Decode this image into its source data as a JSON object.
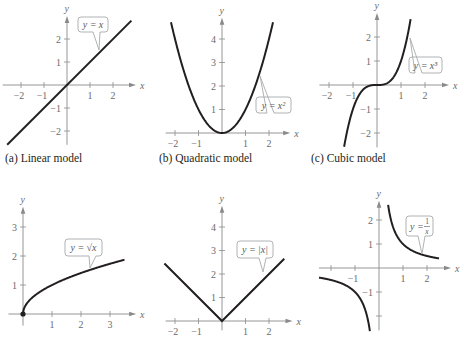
{
  "chart_data": [
    {
      "type": "line",
      "panel": "a",
      "title": "(a)  Linear model",
      "function": "y = x",
      "label": "y = x",
      "xlabel": "x",
      "ylabel": "y",
      "xticks": [
        -2,
        -1,
        1,
        2
      ],
      "yticks": [
        -2,
        -1,
        1,
        2
      ],
      "xlim": [
        -2.8,
        3.0
      ],
      "ylim": [
        -2.6,
        3.0
      ],
      "grid": false,
      "points": [
        [
          -2.6,
          -2.6
        ],
        [
          2.8,
          2.8
        ]
      ],
      "origin_px": [
        67,
        85
      ],
      "unit_px": 23
    },
    {
      "type": "line",
      "panel": "b",
      "title": "(b)  Quadratic model",
      "function": "y = x^2",
      "label": "y = x²",
      "xlabel": "x",
      "ylabel": "y",
      "xticks": [
        -2,
        -1,
        1,
        2
      ],
      "yticks": [
        1,
        2,
        3,
        4
      ],
      "xlim": [
        -2.4,
        2.9
      ],
      "ylim": [
        0,
        4.9
      ],
      "grid": false,
      "domain": [
        -2.17,
        2.17
      ],
      "origin_px": [
        222,
        133
      ],
      "unit_px": 23.5
    },
    {
      "type": "line",
      "panel": "c",
      "title": "(c)  Cubic model",
      "function": "y = x^3",
      "label": "y = x³",
      "xlabel": "x",
      "ylabel": "y",
      "xticks": [
        -2,
        -1,
        1,
        2
      ],
      "yticks": [
        -2,
        -1,
        1,
        2
      ],
      "xlim": [
        -2.4,
        3.0
      ],
      "ylim": [
        -2.6,
        3.0
      ],
      "grid": false,
      "domain": [
        -1.37,
        1.4
      ],
      "origin_px": [
        377,
        85
      ],
      "unit_px": 24
    },
    {
      "type": "line",
      "panel": "d",
      "title": "",
      "function": "y = sqrt(x)",
      "label": "y = √x",
      "xlabel": "x",
      "ylabel": "y",
      "xticks": [
        1,
        2,
        3
      ],
      "yticks": [
        1,
        2,
        3
      ],
      "xlim": [
        -0.5,
        3.9
      ],
      "ylim": [
        -0.4,
        3.7
      ],
      "grid": false,
      "domain": [
        0,
        3.5
      ],
      "marker_at_origin": true,
      "origin_px": [
        23,
        314
      ],
      "unit_px": 29
    },
    {
      "type": "line",
      "panel": "e",
      "title": "",
      "function": "y = |x|",
      "label": "y = |x|",
      "xlabel": "x",
      "ylabel": "y",
      "xticks": [
        -2,
        -1,
        1,
        2
      ],
      "yticks": [
        1,
        2,
        3,
        4
      ],
      "xlim": [
        -2.4,
        3.0
      ],
      "ylim": [
        -0.4,
        4.9
      ],
      "grid": false,
      "points": [
        [
          -2.45,
          2.45
        ],
        [
          0,
          0
        ],
        [
          2.65,
          2.65
        ]
      ],
      "origin_px": [
        222,
        321
      ],
      "unit_px": 23.5
    },
    {
      "type": "line",
      "panel": "f",
      "title": "",
      "function": "y = 1/x",
      "label": "y = 1/x",
      "xlabel": "x",
      "ylabel": "y",
      "xticks": [
        -2,
        -1,
        1,
        2
      ],
      "xtick_labels": [
        "",
        "−1",
        "1",
        "2"
      ],
      "yticks": [
        -2,
        -1,
        1,
        2
      ],
      "ytick_labels": [
        "",
        "−1",
        "1",
        "2"
      ],
      "xlim": [
        -2.5,
        3.0
      ],
      "ylim": [
        -2.6,
        2.8
      ],
      "grid": false,
      "branches": [
        [
          -2.5,
          -0.38
        ],
        [
          0.38,
          2.5
        ]
      ],
      "origin_px": [
        379,
        268
      ],
      "unit_px": 24
    }
  ],
  "captions": {
    "a": "(a)  Linear model",
    "b": "(b)  Quadratic model",
    "c": "(c)  Cubic model"
  }
}
